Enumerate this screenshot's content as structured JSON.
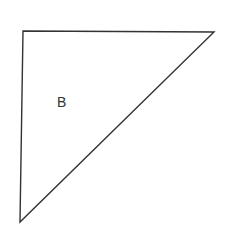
{
  "diagram": {
    "type": "triangle",
    "label": "B",
    "stroke_color": "#333333",
    "background": "#ffffff"
  }
}
